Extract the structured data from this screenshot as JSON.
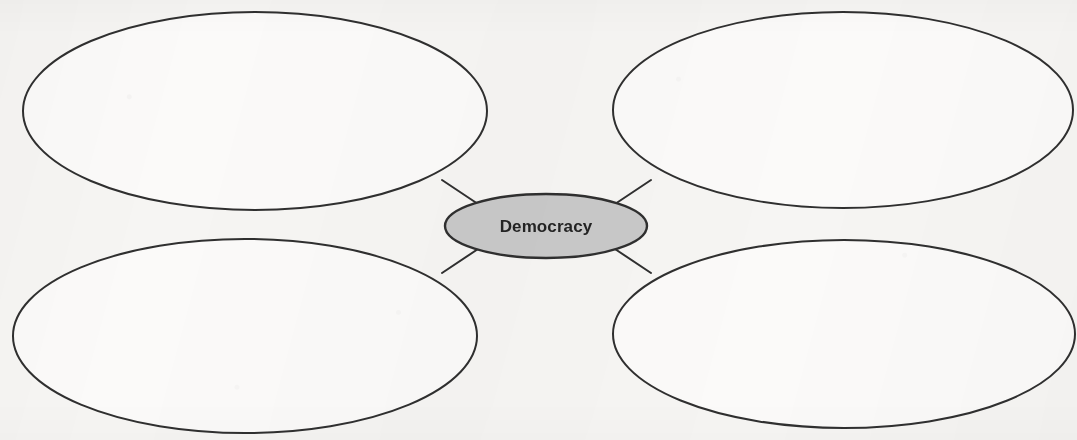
{
  "diagram": {
    "type": "concept-web",
    "background_color": "#f6f5f3",
    "stroke_color": "#2f2f2f",
    "stroke_width": 2,
    "center": {
      "label": "Democracy",
      "fill_color": "#c9c9c9",
      "text_color": "#242424",
      "cx": 546,
      "cy": 226,
      "rx": 101,
      "ry": 32
    },
    "branches": [
      {
        "id": "top-left",
        "label": "",
        "fill_color": "#ffffff",
        "cx": 255,
        "cy": 111,
        "rx": 232,
        "ry": 99
      },
      {
        "id": "top-right",
        "label": "",
        "fill_color": "#ffffff",
        "cx": 843,
        "cy": 110,
        "rx": 230,
        "ry": 98
      },
      {
        "id": "bottom-left",
        "label": "",
        "fill_color": "#ffffff",
        "cx": 245,
        "cy": 336,
        "rx": 232,
        "ry": 97
      },
      {
        "id": "bottom-right",
        "label": "",
        "fill_color": "#ffffff",
        "cx": 844,
        "cy": 334,
        "rx": 231,
        "ry": 94
      }
    ],
    "connectors": [
      {
        "id": "connector-top-left",
        "x1": 481,
        "y1": 206,
        "x2": 442,
        "y2": 180
      },
      {
        "id": "connector-top-right",
        "x1": 612,
        "y1": 206,
        "x2": 651,
        "y2": 180
      },
      {
        "id": "connector-bottom-left",
        "x1": 481,
        "y1": 247,
        "x2": 442,
        "y2": 273
      },
      {
        "id": "connector-bottom-right",
        "x1": 612,
        "y1": 247,
        "x2": 651,
        "y2": 273
      }
    ]
  }
}
